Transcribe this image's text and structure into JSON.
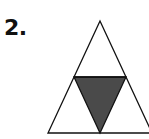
{
  "problem": {
    "number_label": "2."
  },
  "figure": {
    "outer_triangle": {
      "apex": [
        100,
        21
      ],
      "base_left": [
        48,
        133
      ],
      "base_right": [
        152,
        133
      ]
    },
    "inner_triangle": {
      "top_left": [
        74,
        77
      ],
      "top_right": [
        126,
        77
      ],
      "bottom": [
        100,
        133
      ]
    },
    "colors": {
      "stroke": "#111111",
      "shaded_fill": "#4a4a4a",
      "background": "#ffffff"
    }
  }
}
